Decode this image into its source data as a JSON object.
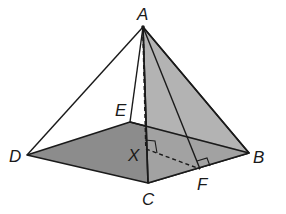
{
  "diagram": {
    "type": "square pyramid",
    "colors": {
      "stroke": "#1a1a1a",
      "base_fill": "#8c8c8c",
      "face_fill": "#a6a6a6",
      "background": "#ffffff"
    },
    "labels": {
      "A": "A",
      "B": "B",
      "C": "C",
      "D": "D",
      "E": "E",
      "F": "F",
      "X": "X"
    },
    "vertices": {
      "A": [
        143,
        27
      ],
      "B": [
        249,
        153
      ],
      "C": [
        148,
        183
      ],
      "D": [
        27,
        155
      ],
      "E": [
        130,
        122
      ],
      "X": [
        146,
        149
      ],
      "F": [
        200,
        169
      ]
    },
    "segments": [
      {
        "from": "A",
        "to": "D",
        "style": "solid"
      },
      {
        "from": "A",
        "to": "E",
        "style": "solid"
      },
      {
        "from": "A",
        "to": "C",
        "style": "solid"
      },
      {
        "from": "A",
        "to": "B",
        "style": "solid"
      },
      {
        "from": "A",
        "to": "F",
        "style": "solid"
      },
      {
        "from": "A",
        "to": "X",
        "style": "dashed"
      },
      {
        "from": "X",
        "to": "F",
        "style": "dashed"
      },
      {
        "from": "E",
        "to": "B",
        "style": "solid"
      },
      {
        "from": "D",
        "to": "E",
        "style": "solid"
      },
      {
        "from": "D",
        "to": "C",
        "style": "solid"
      },
      {
        "from": "C",
        "to": "B",
        "style": "solid"
      }
    ],
    "right_angles": [
      "X",
      "F"
    ]
  }
}
